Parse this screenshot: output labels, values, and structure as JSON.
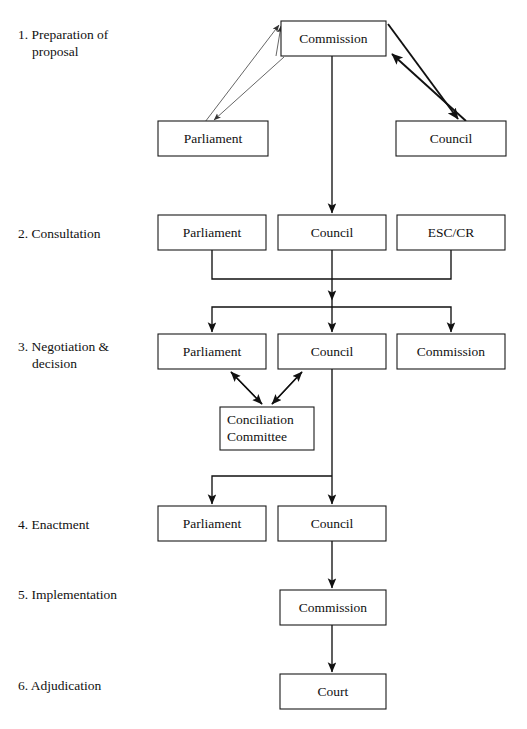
{
  "diagram": {
    "background_color": "#ffffff",
    "line_color": "#111111",
    "box_fill": "#ffffff",
    "box_stroke": "#1a1a1a",
    "stages": [
      {
        "id": "stage-1",
        "label": "1. Preparation of",
        "label_line2": "proposal"
      },
      {
        "id": "stage-2",
        "label": "2. Consultation",
        "label_line2": ""
      },
      {
        "id": "stage-3",
        "label": "3. Negotiation &",
        "label_line2": "decision"
      },
      {
        "id": "stage-4",
        "label": "4. Enactment",
        "label_line2": ""
      },
      {
        "id": "stage-5",
        "label": "5. Implementation",
        "label_line2": ""
      },
      {
        "id": "stage-6",
        "label": "6. Adjudication",
        "label_line2": ""
      }
    ],
    "nodes": [
      {
        "id": "n1-commission",
        "label": "Commission",
        "stage": 1,
        "x": 281,
        "y": 21,
        "w": 105,
        "h": 35
      },
      {
        "id": "n1-parliament",
        "label": "Parliament",
        "stage": 1,
        "x": 158,
        "y": 121,
        "w": 110,
        "h": 35
      },
      {
        "id": "n1-council",
        "label": "Council",
        "stage": 1,
        "x": 396,
        "y": 121,
        "w": 110,
        "h": 35
      },
      {
        "id": "n2-parliament",
        "label": "Parliament",
        "stage": 2,
        "x": 158,
        "y": 215,
        "w": 108,
        "h": 35
      },
      {
        "id": "n2-council",
        "label": "Council",
        "stage": 2,
        "x": 278,
        "y": 215,
        "w": 108,
        "h": 35
      },
      {
        "id": "n2-esccr",
        "label": "ESC/CR",
        "stage": 2,
        "x": 397,
        "y": 215,
        "w": 108,
        "h": 35
      },
      {
        "id": "n3-parliament",
        "label": "Parliament",
        "stage": 3,
        "x": 158,
        "y": 334,
        "w": 108,
        "h": 35
      },
      {
        "id": "n3-council",
        "label": "Council",
        "stage": 3,
        "x": 278,
        "y": 334,
        "w": 108,
        "h": 35
      },
      {
        "id": "n3-commission",
        "label": "Commission",
        "stage": 3,
        "x": 397,
        "y": 334,
        "w": 108,
        "h": 35
      },
      {
        "id": "n3-conciliation",
        "label": "Conciliation",
        "label_line2": "Committee",
        "stage": 3,
        "x": 220,
        "y": 407,
        "w": 94,
        "h": 43
      },
      {
        "id": "n4-parliament",
        "label": "Parliament",
        "stage": 4,
        "x": 158,
        "y": 506,
        "w": 108,
        "h": 35
      },
      {
        "id": "n4-council",
        "label": "Council",
        "stage": 4,
        "x": 278,
        "y": 506,
        "w": 108,
        "h": 35
      },
      {
        "id": "n5-commission",
        "label": "Commission",
        "stage": 5,
        "x": 280,
        "y": 590,
        "w": 106,
        "h": 35
      },
      {
        "id": "n6-court",
        "label": "Court",
        "stage": 6,
        "x": 280,
        "y": 674,
        "w": 106,
        "h": 35
      }
    ],
    "edges": [
      {
        "id": "e-commission-parliament",
        "from": "n1-commission",
        "to": "n1-parliament",
        "type": "double-diagonal-thin"
      },
      {
        "id": "e-commission-council",
        "from": "n1-commission",
        "to": "n1-council",
        "type": "double-diagonal-thick"
      },
      {
        "id": "e-commission-to-stage2",
        "from": "n1-commission",
        "to": "n2-council",
        "type": "vertical-arrow"
      },
      {
        "id": "e-stage2-merge",
        "from": "n2-parliament,n2-esccr",
        "to": "n2-council",
        "type": "merge-elbow"
      },
      {
        "id": "e-stage2-to-stage3",
        "from": "n2-council",
        "to": "n3-parliament,n3-council,n3-commission",
        "type": "split-fork"
      },
      {
        "id": "e-parliament-conciliation",
        "from": "n3-parliament",
        "to": "n3-conciliation",
        "type": "double-diagonal"
      },
      {
        "id": "e-council-conciliation",
        "from": "n3-council",
        "to": "n3-conciliation",
        "type": "double-diagonal"
      },
      {
        "id": "e-stage3-to-stage4",
        "from": "n3-council",
        "to": "n4-parliament,n4-council",
        "type": "split-elbow"
      },
      {
        "id": "e-stage4-to-stage5",
        "from": "n4-council",
        "to": "n5-commission",
        "type": "vertical-arrow"
      },
      {
        "id": "e-stage5-to-stage6",
        "from": "n5-commission",
        "to": "n6-court",
        "type": "vertical-arrow"
      }
    ]
  }
}
